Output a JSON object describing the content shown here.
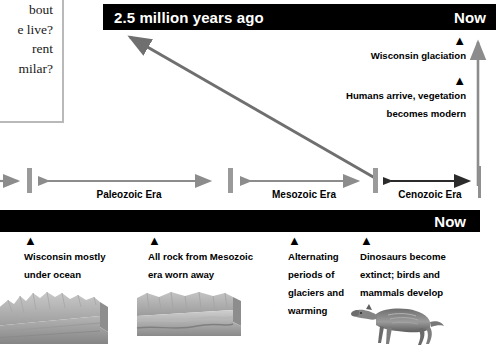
{
  "question_box": {
    "lines": [
      "bout",
      "e live?",
      "rent",
      "milar?"
    ]
  },
  "top_bar": {
    "left_label": "2.5 million years ago",
    "right_label": "Now"
  },
  "bottom_bar": {
    "right_label": "Now"
  },
  "events": [
    {
      "marker": "▲",
      "text": "Wisconsin glaciation"
    },
    {
      "marker": "▲",
      "text": "Humans arrive, vegetation\nbecomes modern"
    }
  ],
  "eras": [
    {
      "label": "Paleozoic Era"
    },
    {
      "label": "Mesozoic Era"
    },
    {
      "label": "Cenozoic Era"
    }
  ],
  "captions": [
    {
      "marker": "▲",
      "text": "Wisconsin mostly\nunder ocean"
    },
    {
      "marker": "▲",
      "text": "All rock from Mesozoic\nera worn away"
    },
    {
      "marker": "▲",
      "text": "Alternating\nperiods of\nglaciers and\nwarming"
    },
    {
      "marker": "▲",
      "text": "Dinosaurs become\nextinct; birds and\nmammals develop"
    }
  ],
  "colors": {
    "bar_background": "#000000",
    "bar_text": "#ffffff",
    "gray_arrow": "#8c8c8c",
    "dark_arrow": "#2b2b2b",
    "tick": "#9a9a9a",
    "box_border": "#b9b9b9"
  }
}
